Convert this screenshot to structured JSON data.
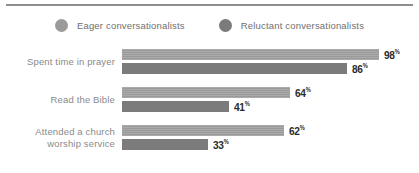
{
  "legend": {
    "items": [
      {
        "label": "Eager conversationalists",
        "marker": "circle-marker-icon",
        "color": "#9a9a9a"
      },
      {
        "label": "Reluctant conversationalists",
        "marker": "circle-marker-icon",
        "color": "#7b7b7b"
      }
    ]
  },
  "chart_data": {
    "type": "bar",
    "orientation": "horizontal",
    "title": "",
    "subtitle": "",
    "xlabel": "",
    "ylabel": "",
    "xlim": [
      0,
      100
    ],
    "grid": false,
    "legend_position": "top-center",
    "value_suffix": "%",
    "categories": [
      "Spent time in prayer",
      "Read the Bible",
      "Attended a church worship service"
    ],
    "series": [
      {
        "name": "Eager conversationalists",
        "color": "#9a9a9a",
        "values": [
          98,
          64,
          62
        ]
      },
      {
        "name": "Reluctant conversationalists",
        "color": "#7b7b7b",
        "values": [
          86,
          41,
          33
        ]
      }
    ]
  },
  "groups": [
    {
      "label_lines": [
        "Spent time in prayer"
      ],
      "bars": [
        {
          "series": "Eager conversationalists",
          "value": 98,
          "value_text": "98",
          "pct": "%"
        },
        {
          "series": "Reluctant conversationalists",
          "value": 86,
          "value_text": "86",
          "pct": "%"
        }
      ]
    },
    {
      "label_lines": [
        "Read the Bible"
      ],
      "bars": [
        {
          "series": "Eager conversationalists",
          "value": 64,
          "value_text": "64",
          "pct": "%"
        },
        {
          "series": "Reluctant conversationalists",
          "value": 41,
          "value_text": "41",
          "pct": "%"
        }
      ]
    },
    {
      "label_lines": [
        "Attended a church",
        "worship service"
      ],
      "bars": [
        {
          "series": "Eager conversationalists",
          "value": 62,
          "value_text": "62",
          "pct": "%"
        },
        {
          "series": "Reluctant conversationalists",
          "value": 33,
          "value_text": "33",
          "pct": "%"
        }
      ]
    }
  ]
}
